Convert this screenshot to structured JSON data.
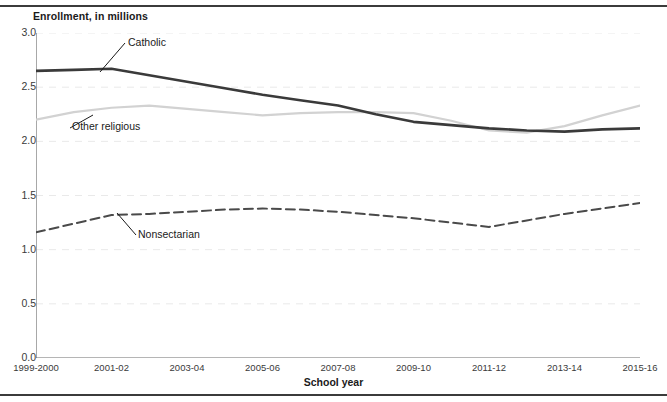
{
  "figure": {
    "y_axis_title": "Enrollment, in millions",
    "x_axis_title": "School year"
  },
  "chart_data": {
    "type": "line",
    "title": "",
    "subtitle": "",
    "xlabel": "School year",
    "ylabel": "Enrollment, in millions",
    "ylim": [
      0.0,
      3.0
    ],
    "ytick_labels": [
      "0.0",
      "0.5",
      "1.0",
      "1.5",
      "2.0",
      "2.5",
      "3.0"
    ],
    "ytick_values": [
      0.0,
      0.5,
      1.0,
      1.5,
      2.0,
      2.5,
      3.0
    ],
    "grid": "horizontal-dashed-light",
    "legend": "inline-annotations",
    "x": [
      "1999-2000",
      "2000-01",
      "2001-02",
      "2002-03",
      "2003-04",
      "2004-05",
      "2005-06",
      "2006-07",
      "2007-08",
      "2008-09",
      "2009-10",
      "2010-11",
      "2011-12",
      "2012-13",
      "2013-14",
      "2014-15",
      "2015-16"
    ],
    "xtick_labels": [
      "1999-2000",
      "2001-02",
      "2003-04",
      "2005-06",
      "2007-08",
      "2009-10",
      "2011-12",
      "2013-14",
      "2015-16"
    ],
    "xtick_indices": [
      0,
      2,
      4,
      6,
      8,
      10,
      12,
      14,
      16
    ],
    "series": [
      {
        "name": "Catholic",
        "color": "#3a3a3a",
        "style": "solid",
        "width": 2.6,
        "values": [
          2.65,
          2.66,
          2.67,
          2.61,
          2.55,
          2.49,
          2.43,
          2.38,
          2.33,
          2.25,
          2.18,
          2.15,
          2.12,
          2.1,
          2.09,
          2.11,
          2.12
        ]
      },
      {
        "name": "Other religious",
        "color": "#d2d2d2",
        "style": "solid",
        "width": 2.2,
        "values": [
          2.2,
          2.27,
          2.31,
          2.33,
          2.3,
          2.27,
          2.24,
          2.26,
          2.27,
          2.27,
          2.26,
          2.19,
          2.1,
          2.08,
          2.14,
          2.24,
          2.33
        ]
      },
      {
        "name": "Nonsectarian",
        "color": "#4a4a4a",
        "style": "dashed",
        "width": 2.0,
        "values": [
          1.16,
          1.24,
          1.32,
          1.33,
          1.35,
          1.37,
          1.38,
          1.37,
          1.35,
          1.32,
          1.29,
          1.25,
          1.21,
          1.27,
          1.33,
          1.38,
          1.43
        ]
      }
    ],
    "annotations": [
      {
        "label": "Catholic",
        "text_x": 128,
        "text_y": 36,
        "leader": [
          100,
          72,
          125,
          43
        ]
      },
      {
        "label": "Other religious",
        "text_x": 72,
        "text_y": 120,
        "leader": [
          93,
          115,
          70,
          128
        ]
      },
      {
        "label": "Nonsectarian",
        "text_x": 138,
        "text_y": 228,
        "leader": [
          117,
          213,
          136,
          235
        ]
      }
    ]
  }
}
